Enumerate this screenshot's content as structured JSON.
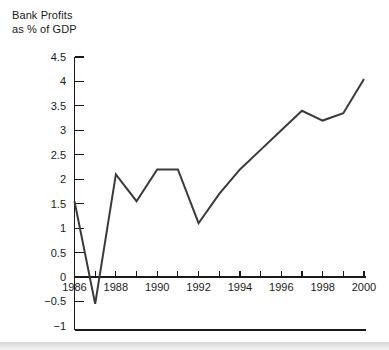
{
  "chart_data": {
    "type": "line",
    "title_line1": "Bank Profits",
    "title_line2": "as % of GDP",
    "xlabel": "",
    "ylabel": "Bank Profits as % of GDP",
    "x": [
      1986,
      1987,
      1988,
      1989,
      1990,
      1991,
      1992,
      1993,
      1994,
      1995,
      1996,
      1997,
      1998,
      1999,
      2000
    ],
    "values": [
      1.55,
      -0.55,
      2.1,
      1.55,
      2.2,
      2.2,
      1.1,
      1.7,
      2.2,
      2.6,
      3.0,
      3.4,
      3.2,
      3.35,
      4.05
    ],
    "series": [
      {
        "name": "Bank Profits as % of GDP",
        "values": [
          1.55,
          -0.55,
          2.1,
          1.55,
          2.2,
          2.2,
          1.1,
          1.7,
          2.2,
          2.6,
          3.0,
          3.4,
          3.2,
          3.35,
          4.05
        ]
      }
    ],
    "xlim": [
      1986,
      2000
    ],
    "ylim": [
      -1,
      4.5
    ],
    "ytick_values": [
      4.5,
      4,
      3.5,
      3,
      2.5,
      2,
      1.5,
      1,
      0.5,
      0,
      -0.5,
      -1
    ],
    "ytick_labels": [
      "4.5",
      "4",
      "3.5",
      "3",
      "2.5",
      "2",
      "1.5",
      "1",
      "0.5",
      "0",
      "−0.5",
      "−1"
    ],
    "xtick_values": [
      1986,
      1987,
      1988,
      1989,
      1990,
      1991,
      1992,
      1993,
      1994,
      1995,
      1996,
      1997,
      1998,
      1999,
      2000
    ],
    "xtick_labels": [
      "1986",
      "",
      "1988",
      "",
      "1990",
      "",
      "1992",
      "",
      "1994",
      "",
      "1996",
      "",
      "1998",
      "",
      "2000"
    ],
    "xtick_labeled": [
      1986,
      1988,
      1990,
      1992,
      1994,
      1996,
      1998,
      2000
    ],
    "grid": false,
    "legend": "none",
    "line_color": "#3a3a3a",
    "axis_color": "#1a1a1a",
    "zero_line": 0
  }
}
